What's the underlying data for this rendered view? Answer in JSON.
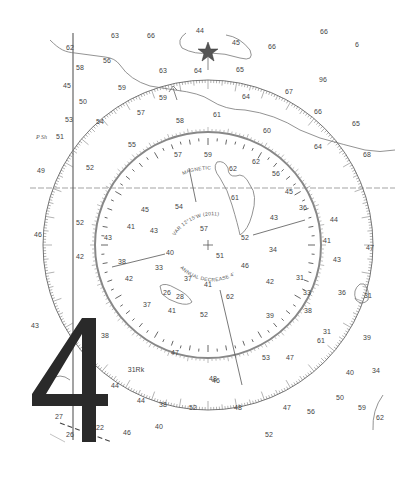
{
  "chart": {
    "type": "nautical-chart-excerpt",
    "overlay_digit": "4",
    "compass_rose": {
      "center": [
        208,
        245
      ],
      "outer_radius": 165,
      "inner_radius": 113,
      "magnetic_label": "MAGNETIC",
      "variation_text": "VAR 12°15'W (2011)",
      "annual_decrease_text": "ANNUAL DECREASE 4'"
    },
    "soundings": [
      {
        "x": 70,
        "y": 50,
        "v": "62"
      },
      {
        "x": 115,
        "y": 38,
        "v": "63"
      },
      {
        "x": 151,
        "y": 38,
        "v": "66"
      },
      {
        "x": 200,
        "y": 33,
        "v": "44"
      },
      {
        "x": 236,
        "y": 45,
        "v": "45"
      },
      {
        "x": 272,
        "y": 49,
        "v": "66"
      },
      {
        "x": 324,
        "y": 34,
        "v": "66"
      },
      {
        "x": 357,
        "y": 47,
        "v": "6"
      },
      {
        "x": 80,
        "y": 70,
        "v": "58"
      },
      {
        "x": 107,
        "y": 63,
        "v": "56"
      },
      {
        "x": 163,
        "y": 73,
        "v": "63"
      },
      {
        "x": 198,
        "y": 73,
        "v": "64"
      },
      {
        "x": 240,
        "y": 72,
        "v": "65"
      },
      {
        "x": 323,
        "y": 82,
        "v": "96"
      },
      {
        "x": 67,
        "y": 88,
        "v": "45"
      },
      {
        "x": 122,
        "y": 90,
        "v": "59"
      },
      {
        "x": 163,
        "y": 100,
        "v": "59"
      },
      {
        "x": 246,
        "y": 99,
        "v": "64"
      },
      {
        "x": 289,
        "y": 94,
        "v": "67"
      },
      {
        "x": 83,
        "y": 104,
        "v": "50"
      },
      {
        "x": 141,
        "y": 115,
        "v": "57"
      },
      {
        "x": 318,
        "y": 114,
        "v": "66"
      },
      {
        "x": 69,
        "y": 122,
        "v": "53"
      },
      {
        "x": 100,
        "y": 124,
        "v": "54"
      },
      {
        "x": 180,
        "y": 123,
        "v": "58"
      },
      {
        "x": 217,
        "y": 117,
        "v": "61"
      },
      {
        "x": 267,
        "y": 133,
        "v": "60"
      },
      {
        "x": 356,
        "y": 126,
        "v": "65"
      },
      {
        "x": 60,
        "y": 139,
        "v": "51"
      },
      {
        "x": 132,
        "y": 147,
        "v": "55"
      },
      {
        "x": 318,
        "y": 149,
        "v": "64"
      },
      {
        "x": 367,
        "y": 157,
        "v": "68"
      },
      {
        "x": 178,
        "y": 157,
        "v": "57"
      },
      {
        "x": 208,
        "y": 157,
        "v": "59"
      },
      {
        "x": 233,
        "y": 171,
        "v": "62"
      },
      {
        "x": 256,
        "y": 164,
        "v": "62"
      },
      {
        "x": 276,
        "y": 176,
        "v": "56"
      },
      {
        "x": 90,
        "y": 170,
        "v": "52"
      },
      {
        "x": 41,
        "y": 173,
        "v": "49"
      },
      {
        "x": 235,
        "y": 200,
        "v": "61"
      },
      {
        "x": 289,
        "y": 194,
        "v": "45"
      },
      {
        "x": 145,
        "y": 212,
        "v": "45"
      },
      {
        "x": 179,
        "y": 209,
        "v": "54"
      },
      {
        "x": 303,
        "y": 210,
        "v": "36"
      },
      {
        "x": 80,
        "y": 225,
        "v": "52"
      },
      {
        "x": 131,
        "y": 229,
        "v": "41"
      },
      {
        "x": 154,
        "y": 233,
        "v": "43"
      },
      {
        "x": 204,
        "y": 231,
        "v": "57"
      },
      {
        "x": 274,
        "y": 220,
        "v": "43"
      },
      {
        "x": 334,
        "y": 222,
        "v": "44"
      },
      {
        "x": 38,
        "y": 237,
        "v": "46"
      },
      {
        "x": 108,
        "y": 240,
        "v": "43"
      },
      {
        "x": 245,
        "y": 240,
        "v": "52"
      },
      {
        "x": 327,
        "y": 243,
        "v": "41"
      },
      {
        "x": 370,
        "y": 250,
        "v": "47"
      },
      {
        "x": 80,
        "y": 259,
        "v": "42"
      },
      {
        "x": 170,
        "y": 255,
        "v": "40"
      },
      {
        "x": 220,
        "y": 258,
        "v": "51"
      },
      {
        "x": 273,
        "y": 252,
        "v": "34"
      },
      {
        "x": 122,
        "y": 264,
        "v": "38"
      },
      {
        "x": 159,
        "y": 270,
        "v": "33"
      },
      {
        "x": 245,
        "y": 268,
        "v": "46"
      },
      {
        "x": 300,
        "y": 280,
        "v": "31"
      },
      {
        "x": 337,
        "y": 262,
        "v": "43"
      },
      {
        "x": 129,
        "y": 281,
        "v": "42"
      },
      {
        "x": 188,
        "y": 281,
        "v": "37"
      },
      {
        "x": 208,
        "y": 287,
        "v": "41"
      },
      {
        "x": 270,
        "y": 284,
        "v": "42"
      },
      {
        "x": 307,
        "y": 295,
        "v": "33"
      },
      {
        "x": 342,
        "y": 295,
        "v": "36"
      },
      {
        "x": 368,
        "y": 298,
        "v": "31"
      },
      {
        "x": 167,
        "y": 295,
        "v": "26"
      },
      {
        "x": 180,
        "y": 299,
        "v": "28"
      },
      {
        "x": 230,
        "y": 299,
        "v": "62"
      },
      {
        "x": 147,
        "y": 307,
        "v": "37"
      },
      {
        "x": 172,
        "y": 313,
        "v": "41"
      },
      {
        "x": 204,
        "y": 317,
        "v": "52"
      },
      {
        "x": 270,
        "y": 318,
        "v": "39"
      },
      {
        "x": 308,
        "y": 313,
        "v": "38"
      },
      {
        "x": 35,
        "y": 328,
        "v": "43"
      },
      {
        "x": 105,
        "y": 338,
        "v": "38"
      },
      {
        "x": 327,
        "y": 334,
        "v": "31"
      },
      {
        "x": 321,
        "y": 343,
        "v": "61"
      },
      {
        "x": 367,
        "y": 340,
        "v": "39"
      },
      {
        "x": 175,
        "y": 355,
        "v": "47"
      },
      {
        "x": 266,
        "y": 360,
        "v": "53"
      },
      {
        "x": 290,
        "y": 360,
        "v": "47"
      },
      {
        "x": 350,
        "y": 375,
        "v": "40"
      },
      {
        "x": 376,
        "y": 373,
        "v": "34"
      },
      {
        "x": 136,
        "y": 372,
        "v": "31Rk"
      },
      {
        "x": 115,
        "y": 388,
        "v": "44"
      },
      {
        "x": 213,
        "y": 381,
        "v": "48"
      },
      {
        "x": 216,
        "y": 383,
        "v": "46"
      },
      {
        "x": 141,
        "y": 403,
        "v": "44"
      },
      {
        "x": 163,
        "y": 407,
        "v": "38"
      },
      {
        "x": 193,
        "y": 410,
        "v": "52"
      },
      {
        "x": 238,
        "y": 410,
        "v": "48"
      },
      {
        "x": 287,
        "y": 410,
        "v": "47"
      },
      {
        "x": 311,
        "y": 414,
        "v": "56"
      },
      {
        "x": 340,
        "y": 400,
        "v": "50"
      },
      {
        "x": 362,
        "y": 410,
        "v": "59"
      },
      {
        "x": 380,
        "y": 420,
        "v": "62"
      },
      {
        "x": 59,
        "y": 419,
        "v": "27"
      },
      {
        "x": 159,
        "y": 429,
        "v": "40"
      },
      {
        "x": 127,
        "y": 435,
        "v": "46"
      },
      {
        "x": 70,
        "y": 437,
        "v": "26"
      },
      {
        "x": 100,
        "y": 430,
        "v": "22"
      },
      {
        "x": 269,
        "y": 437,
        "v": "52"
      }
    ],
    "labels": [
      {
        "x": 36,
        "y": 139,
        "v": "P Sh"
      }
    ]
  }
}
